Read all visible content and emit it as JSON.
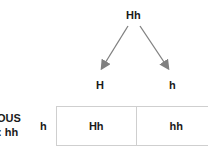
{
  "parent": {
    "genotype": "Hh"
  },
  "gametes": [
    {
      "allele": "H"
    },
    {
      "allele": "h"
    }
  ],
  "left_label": {
    "line1": "OUS",
    "line2": ": hh"
  },
  "row_allele": "h",
  "punnett_row": [
    {
      "genotype": "Hh"
    },
    {
      "genotype": "hh"
    }
  ],
  "colors": {
    "text": "#1a1a1a",
    "arrow": "#808080",
    "grid": "#cfcfcf"
  }
}
